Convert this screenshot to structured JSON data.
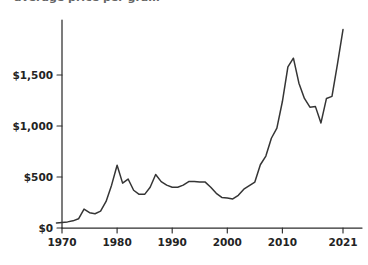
{
  "title_fragment": "average price per gram",
  "chart_data": {
    "type": "line",
    "title": "",
    "xlabel": "",
    "ylabel": "",
    "xlim": [
      1969,
      2022
    ],
    "ylim": [
      0,
      2000
    ],
    "grid": false,
    "legend": null,
    "y_ticks": [
      0,
      500,
      1000,
      1500
    ],
    "y_tick_labels": [
      "$0",
      "$500",
      "$1,000",
      "$1,500"
    ],
    "x_ticks": [
      1970,
      1980,
      1990,
      2000,
      2010,
      2021
    ],
    "x_tick_labels": [
      "1970",
      "1980",
      "1990",
      "2000",
      "2010",
      "2021"
    ],
    "series": [
      {
        "name": "price",
        "color": "#353535",
        "x": [
          1969,
          1970,
          1971,
          1972,
          1973,
          1974,
          1975,
          1976,
          1977,
          1978,
          1979,
          1980,
          1981,
          1982,
          1983,
          1984,
          1985,
          1986,
          1987,
          1988,
          1989,
          1990,
          1991,
          1992,
          1993,
          1994,
          1995,
          1996,
          1997,
          1998,
          1999,
          2000,
          2001,
          2002,
          2003,
          2004,
          2005,
          2006,
          2007,
          2008,
          2009,
          2010,
          2011,
          2012,
          2013,
          2014,
          2015,
          2016,
          2017,
          2018,
          2019,
          2020,
          2021
        ],
        "y": [
          50,
          55,
          60,
          70,
          90,
          185,
          150,
          140,
          165,
          260,
          420,
          615,
          440,
          480,
          370,
          330,
          330,
          400,
          525,
          455,
          420,
          400,
          400,
          420,
          455,
          455,
          450,
          450,
          400,
          340,
          300,
          295,
          285,
          320,
          380,
          415,
          450,
          620,
          705,
          880,
          980,
          1240,
          1580,
          1665,
          1420,
          1270,
          1185,
          1190,
          1030,
          1270,
          1290,
          1610,
          1945
        ]
      }
    ]
  }
}
